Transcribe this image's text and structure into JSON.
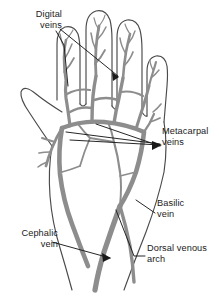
{
  "figure": {
    "background_color": "#ffffff",
    "outline_color": "#4a4a4a",
    "vein_fill_color": "#8d8d8d",
    "vein_outline_color": "#5a5a5a",
    "leader_line_color": "#1a1a1a",
    "text_color": "#1a1a1a"
  },
  "labels": {
    "digital": {
      "line1": "Digital",
      "line2": "veins",
      "align": "right"
    },
    "metacarpal": {
      "line1": "Metacarpal",
      "line2": "veins",
      "align": "left"
    },
    "basilic": {
      "line1": "Basilic",
      "line2": "vein",
      "align": "left"
    },
    "dorsal_venous_arch": {
      "line1": "Dorsal venous",
      "line2": "arch",
      "align": "left"
    },
    "cephalic": {
      "line1": "Cephalic",
      "line2": "vein",
      "align": "right"
    }
  }
}
